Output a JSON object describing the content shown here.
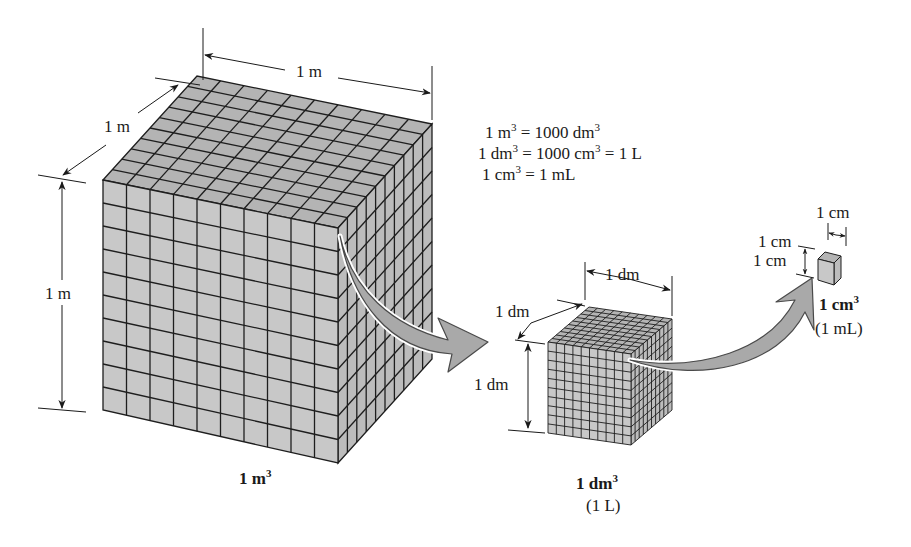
{
  "figure": {
    "colors": {
      "background": "#ffffff",
      "front_face": "#c8c8c8",
      "top_face": "#b4b4b4",
      "side_face": "#bcbcbc",
      "grid_line": "#1e1e1e",
      "arrow_fill": "#a9a9a9",
      "arrow_stroke": "#4a4a4a",
      "text": "#1a1a1a"
    },
    "equations": [
      {
        "lhs": "1 m",
        "lhs_sup": "3",
        "mid": " = 1000 dm",
        "mid_sup": "3",
        "rhs": ""
      },
      {
        "lhs": "1 dm",
        "lhs_sup": "3",
        "mid": " = 1000 cm",
        "mid_sup": "3",
        "rhs": " = 1 L"
      },
      {
        "lhs": "1 cm",
        "lhs_sup": "3",
        "mid": " = 1 mL",
        "mid_sup": "",
        "rhs": ""
      }
    ],
    "cubes": [
      {
        "id": "cubic-meter",
        "divisions": 10,
        "dim_width": "1 m",
        "dim_depth": "1 m",
        "dim_height": "1 m",
        "caption": "1 m",
        "caption_sup": "3",
        "subcaption": ""
      },
      {
        "id": "cubic-decimeter",
        "divisions": 10,
        "dim_width": "1 dm",
        "dim_depth": "1 dm",
        "dim_height": "1 dm",
        "caption": "1 dm",
        "caption_sup": "3",
        "subcaption": "(1 L)"
      },
      {
        "id": "cubic-centimeter",
        "divisions": 1,
        "dim_width": "1 cm",
        "dim_depth": "1 cm",
        "dim_height": "1 cm",
        "caption": "1 cm",
        "caption_sup": "3",
        "subcaption": "(1 mL)"
      }
    ],
    "arrows": [
      {
        "from": "cubic-meter",
        "to": "cubic-decimeter"
      },
      {
        "from": "cubic-decimeter",
        "to": "cubic-centimeter"
      }
    ]
  }
}
